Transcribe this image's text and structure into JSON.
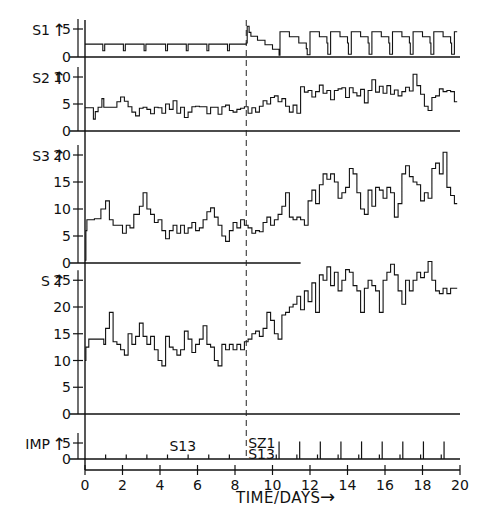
{
  "chart_data": {
    "type": "line",
    "title": "",
    "xlabel": "TIME/DAYS",
    "xlim": [
      0,
      20
    ],
    "x_ticks": [
      0,
      2,
      4,
      6,
      8,
      10,
      12,
      14,
      16,
      18,
      20
    ],
    "x_tick_labels": [
      "0",
      "2",
      "4",
      "6",
      "8",
      "10",
      "12",
      "14",
      "16",
      "18",
      "20"
    ],
    "vline_x": 8.6,
    "panels": [
      {
        "name": "S1",
        "ylabel": "S1",
        "ylim": [
          0,
          5.8
        ],
        "y_ticks": [
          0,
          5
        ],
        "y_tick_labels": [
          "0",
          "5"
        ],
        "step": true,
        "x": [
          0,
          0.95,
          0.95,
          1.05,
          1.05,
          2.05,
          2.05,
          2.15,
          2.15,
          3.15,
          3.15,
          3.25,
          3.25,
          4.3,
          4.3,
          4.4,
          4.4,
          5.4,
          5.4,
          5.5,
          5.5,
          6.5,
          6.5,
          6.6,
          6.6,
          7.6,
          7.6,
          7.7,
          7.7,
          8.6,
          8.65,
          8.75,
          8.85,
          9.2,
          9.6,
          10.0,
          10.3,
          10.35,
          10.4,
          10.9,
          11.4,
          11.8,
          11.85,
          12.0,
          12.5,
          12.9,
          12.95,
          13.1,
          13.6,
          14.0,
          14.05,
          14.2,
          14.7,
          15.1,
          15.15,
          15.3,
          15.8,
          16.2,
          16.25,
          16.4,
          16.9,
          17.3,
          17.35,
          17.5,
          18.0,
          18.4,
          18.45,
          18.6,
          19.1,
          19.5,
          19.55,
          19.7
        ],
        "values": [
          2.3,
          2.3,
          1.1,
          1.1,
          2.3,
          2.3,
          1.1,
          1.1,
          2.3,
          2.3,
          1.1,
          1.1,
          2.3,
          2.3,
          1.1,
          1.1,
          2.3,
          2.3,
          1.1,
          1.1,
          2.3,
          2.3,
          1.1,
          1.1,
          2.3,
          2.3,
          1.1,
          1.1,
          2.3,
          2.5,
          5.5,
          4.4,
          3.7,
          3.0,
          2.2,
          1.4,
          1.4,
          0.3,
          4.5,
          3.6,
          2.5,
          1.5,
          0.4,
          4.5,
          3.6,
          2.5,
          0.5,
          4.5,
          3.6,
          2.5,
          0.5,
          4.5,
          3.6,
          2.5,
          0.5,
          4.5,
          3.6,
          2.5,
          0.5,
          4.5,
          3.6,
          2.5,
          0.5,
          4.5,
          3.6,
          2.5,
          0.5,
          4.5,
          3.6,
          2.5,
          0.5,
          4.5
        ]
      },
      {
        "name": "S2",
        "ylabel": "S2",
        "ylim": [
          0,
          11
        ],
        "y_ticks": [
          0,
          5,
          10
        ],
        "y_tick_labels": [
          "0",
          "5",
          "10"
        ],
        "step": true,
        "x": [
          0,
          0.4,
          0.45,
          0.55,
          0.7,
          0.9,
          1.0,
          1.3,
          1.5,
          1.7,
          1.9,
          2.1,
          2.3,
          2.5,
          2.7,
          2.9,
          3.1,
          3.3,
          3.5,
          3.7,
          3.9,
          4.1,
          4.3,
          4.5,
          4.7,
          4.9,
          5.1,
          5.3,
          5.5,
          5.7,
          5.9,
          6.1,
          6.3,
          6.5,
          6.7,
          6.9,
          7.1,
          7.3,
          7.5,
          7.7,
          7.9,
          8.1,
          8.3,
          8.5,
          8.7,
          8.9,
          9.1,
          9.3,
          9.5,
          9.7,
          9.9,
          10.1,
          10.3,
          10.5,
          10.7,
          10.9,
          11.1,
          11.3,
          11.5,
          11.7,
          11.9,
          12.1,
          12.3,
          12.5,
          12.7,
          12.9,
          13.1,
          13.3,
          13.5,
          13.7,
          13.9,
          14.1,
          14.3,
          14.5,
          14.7,
          14.9,
          15.1,
          15.3,
          15.5,
          15.7,
          15.9,
          16.1,
          16.3,
          16.5,
          16.7,
          16.9,
          17.1,
          17.3,
          17.5,
          17.7,
          17.9,
          18.1,
          18.3,
          18.5,
          18.7,
          18.9,
          19.1,
          19.3,
          19.5,
          19.7
        ],
        "values": [
          4.3,
          4.3,
          2.2,
          3.6,
          4.4,
          6.0,
          4.4,
          4.4,
          4.4,
          5.4,
          6.3,
          5.5,
          4.5,
          3.5,
          2.8,
          4.2,
          4.4,
          4.0,
          3.2,
          4.4,
          4.3,
          3.3,
          5.0,
          4.0,
          5.6,
          3.3,
          4.4,
          2.5,
          3.5,
          4.5,
          4.6,
          4.5,
          4.5,
          3.2,
          4.4,
          4.4,
          3.1,
          4.5,
          4.8,
          3.8,
          3.5,
          4.0,
          4.2,
          4.5,
          3.3,
          4.3,
          3.5,
          4.6,
          5.6,
          5.0,
          6.2,
          6.5,
          5.4,
          6.0,
          4.6,
          3.5,
          4.8,
          3.3,
          8.2,
          7.2,
          7.5,
          6.3,
          7.3,
          8.5,
          7.0,
          7.5,
          5.8,
          7.5,
          7.8,
          8.0,
          6.2,
          8.0,
          7.1,
          6.5,
          7.7,
          5.2,
          7.5,
          9.5,
          7.2,
          8.3,
          7.0,
          8.4,
          6.8,
          7.6,
          6.5,
          7.3,
          8.1,
          7.4,
          10.5,
          8.4,
          6.8,
          4.6,
          3.8,
          6.2,
          6.5,
          7.8,
          7.3,
          7.5,
          7.3,
          5.4
        ],
        "baseline_x_end": 20
      },
      {
        "name": "S3",
        "ylabel": "S3",
        "ylim": [
          0,
          21
        ],
        "y_ticks": [
          0,
          5,
          10,
          15,
          20
        ],
        "y_tick_labels": [
          "0",
          "5",
          "10",
          "15",
          "20"
        ],
        "step": true,
        "x": [
          0,
          0.05,
          0.1,
          0.5,
          0.85,
          1.1,
          1.3,
          1.5,
          1.7,
          2.0,
          2.2,
          2.4,
          2.6,
          2.9,
          3.1,
          3.3,
          3.5,
          3.7,
          3.9,
          4.1,
          4.3,
          4.5,
          4.7,
          4.9,
          5.1,
          5.3,
          5.5,
          5.7,
          5.9,
          6.1,
          6.3,
          6.5,
          6.7,
          6.9,
          7.1,
          7.3,
          7.5,
          7.7,
          7.9,
          8.1,
          8.3,
          8.5,
          8.7,
          8.9,
          9.1,
          9.3,
          9.5,
          9.7,
          9.9,
          10.1,
          10.3,
          10.5,
          10.7,
          10.9,
          11.1,
          11.3,
          11.5,
          11.7,
          11.9,
          12.1,
          12.3,
          12.5,
          12.7,
          12.9,
          13.1,
          13.3,
          13.5,
          13.7,
          13.9,
          14.1,
          14.3,
          14.5,
          14.7,
          14.9,
          15.1,
          15.3,
          15.5,
          15.7,
          15.9,
          16.1,
          16.3,
          16.5,
          16.7,
          16.9,
          17.1,
          17.3,
          17.5,
          17.7,
          17.9,
          18.1,
          18.3,
          18.5,
          18.7,
          18.9,
          19.1,
          19.3,
          19.5,
          19.7
        ],
        "values": [
          0.5,
          6.0,
          8.0,
          8.2,
          10.0,
          11.5,
          8.0,
          7.0,
          7.0,
          5.5,
          7.0,
          6.5,
          9.0,
          10.5,
          13.0,
          10.0,
          9.0,
          7.5,
          8.0,
          6.0,
          4.5,
          6.0,
          7.0,
          5.5,
          7.0,
          5.5,
          6.5,
          7.5,
          6.0,
          6.5,
          8.0,
          9.5,
          10.2,
          8.5,
          7.0,
          5.0,
          4.0,
          6.0,
          7.5,
          6.5,
          8.0,
          7.0,
          6.5,
          5.5,
          6.0,
          5.8,
          7.5,
          8.5,
          7.0,
          8.0,
          9.0,
          10.5,
          13.0,
          8.5,
          8.0,
          8.5,
          8.0,
          7.0,
          11.5,
          13.5,
          11.0,
          14.5,
          16.5,
          15.5,
          16.5,
          15.0,
          12.0,
          13.0,
          14.0,
          17.5,
          16.5,
          13.0,
          10.0,
          9.0,
          13.5,
          10.5,
          14.0,
          13.5,
          12.0,
          14.0,
          13.0,
          8.5,
          11.0,
          16.5,
          18.0,
          16.0,
          15.0,
          14.5,
          11.5,
          13.0,
          12.0,
          17.5,
          18.5,
          16.5,
          20.5,
          14.0,
          12.5,
          11.0,
          15.0
        ],
        "baseline_x_end": 11.5
      },
      {
        "name": "S",
        "ylabel": "S",
        "ylim": [
          0,
          27.5
        ],
        "y_ticks": [
          0,
          5,
          10,
          15,
          20,
          25
        ],
        "y_tick_labels": [
          "0",
          "5",
          "10",
          "15",
          "20",
          "25"
        ],
        "step": true,
        "x": [
          0,
          0.05,
          0.2,
          1.0,
          1.1,
          1.3,
          1.5,
          1.7,
          1.9,
          2.1,
          2.3,
          2.5,
          2.7,
          2.9,
          3.1,
          3.3,
          3.5,
          3.7,
          3.9,
          4.1,
          4.3,
          4.5,
          4.7,
          4.9,
          5.1,
          5.3,
          5.5,
          5.7,
          5.9,
          6.1,
          6.3,
          6.5,
          6.7,
          6.9,
          7.1,
          7.3,
          7.5,
          7.7,
          7.9,
          8.1,
          8.3,
          8.5,
          8.7,
          8.9,
          9.1,
          9.3,
          9.5,
          9.7,
          9.9,
          10.1,
          10.3,
          10.5,
          10.7,
          10.9,
          11.1,
          11.3,
          11.5,
          11.7,
          11.9,
          12.1,
          12.3,
          12.5,
          12.7,
          12.9,
          13.1,
          13.3,
          13.5,
          13.7,
          13.9,
          14.1,
          14.3,
          14.5,
          14.7,
          14.9,
          15.1,
          15.3,
          15.5,
          15.7,
          15.9,
          16.1,
          16.3,
          16.5,
          16.7,
          16.9,
          17.1,
          17.3,
          17.5,
          17.7,
          17.9,
          18.1,
          18.3,
          18.5,
          18.7,
          18.9,
          19.1,
          19.3,
          19.5,
          19.7
        ],
        "values": [
          10.0,
          12.5,
          14.0,
          13.0,
          16.0,
          19.0,
          13.5,
          13.0,
          12.0,
          11.0,
          15.0,
          13.0,
          14.5,
          17.0,
          14.5,
          13.0,
          14.5,
          12.0,
          10.0,
          9.0,
          14.5,
          12.5,
          12.0,
          11.0,
          12.0,
          15.5,
          14.0,
          11.5,
          13.0,
          14.0,
          16.5,
          13.0,
          12.5,
          10.0,
          9.0,
          13.0,
          12.0,
          13.0,
          12.0,
          13.0,
          12.0,
          13.5,
          14.0,
          15.0,
          15.5,
          14.5,
          16.0,
          19.0,
          17.5,
          15.0,
          14.0,
          18.5,
          19.0,
          20.0,
          20.5,
          22.0,
          19.5,
          23.0,
          21.0,
          24.5,
          19.0,
          26.0,
          25.0,
          27.5,
          24.0,
          26.5,
          23.0,
          25.0,
          27.0,
          26.5,
          24.0,
          23.0,
          19.0,
          23.5,
          25.0,
          24.0,
          23.0,
          19.0,
          25.0,
          26.5,
          28.0,
          26.0,
          23.0,
          20.5,
          25.0,
          23.0,
          25.0,
          26.5,
          25.5,
          26.5,
          28.5,
          25.0,
          23.0,
          22.5,
          23.5,
          22.5,
          23.5,
          23.5
        ],
        "baseline_x_end": 20
      },
      {
        "name": "IMP",
        "ylabel": "IMP",
        "ylim": [
          0,
          6.5
        ],
        "y_ticks": [
          0,
          5
        ],
        "y_tick_labels": [
          "0",
          "5"
        ],
        "type": "impulse",
        "series": [
          {
            "name": "S13",
            "x": [
              1.1,
              2.2,
              3.3,
              4.4,
              5.5,
              6.6,
              7.7,
              10.2,
              11.3,
              12.4,
              13.5,
              14.6,
              15.7,
              16.8,
              17.9,
              19.0
            ],
            "values": [
              1.4,
              1.4,
              1.4,
              1.4,
              1.4,
              1.4,
              1.4,
              1.4,
              1.4,
              1.4,
              1.4,
              1.4,
              1.4,
              1.4,
              1.4,
              1.4
            ]
          },
          {
            "name": "SZ1",
            "x": [
              10.35,
              11.45,
              12.55,
              13.65,
              14.75,
              15.85,
              16.95,
              18.05,
              19.15
            ],
            "values": [
              5.5,
              5.5,
              5.5,
              5.5,
              5.5,
              5.5,
              5.5,
              5.5,
              5.5
            ]
          }
        ],
        "annotations": [
          {
            "text": "S13",
            "x": 4.5,
            "y": 4.0
          },
          {
            "text": "SZ1",
            "x": 8.7,
            "y": 5.0
          },
          {
            "text": "S13",
            "x": 8.7,
            "y": 1.6
          }
        ],
        "baseline_x_end": 20
      }
    ]
  },
  "figure": {
    "xlabel_text": "TIME/DAYS",
    "xlabel_arrow": "→",
    "ylabel_arrow": "↑"
  }
}
